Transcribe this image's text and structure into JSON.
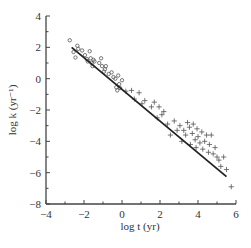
{
  "chart_data": {
    "type": "scatter",
    "title": "",
    "xlabel": "log t  (yr)",
    "ylabel": "log k  (yr⁻¹)",
    "xlim": [
      -4,
      6
    ],
    "ylim": [
      -8,
      4
    ],
    "x_ticks": [
      -4,
      -2,
      0,
      2,
      4,
      6
    ],
    "y_ticks": [
      4,
      2,
      0,
      -2,
      -4,
      -6,
      -8
    ],
    "x_tick_labels": [
      "−4",
      "−2",
      "0",
      "2",
      "4",
      "6"
    ],
    "y_tick_labels": [
      "4",
      "2",
      "0",
      "−2",
      "−4",
      "−6",
      "−8"
    ],
    "grid": false,
    "legend": null,
    "series": [
      {
        "name": "circles",
        "marker": "circle-open",
        "points": [
          [
            -2.75,
            2.45
          ],
          [
            -2.55,
            1.7
          ],
          [
            -2.45,
            1.35
          ],
          [
            -2.35,
            2.1
          ],
          [
            -2.3,
            1.9
          ],
          [
            -2.1,
            1.8
          ],
          [
            -1.95,
            1.5
          ],
          [
            -1.85,
            1.25
          ],
          [
            -1.8,
            1.1
          ],
          [
            -1.7,
            1.75
          ],
          [
            -1.65,
            1.3
          ],
          [
            -1.6,
            1.0
          ],
          [
            -1.55,
            0.8
          ],
          [
            -1.5,
            1.2
          ],
          [
            -1.45,
            1.1
          ],
          [
            -1.2,
            1.0
          ],
          [
            -1.1,
            1.3
          ],
          [
            -1.05,
            0.8
          ],
          [
            -0.95,
            0.45
          ],
          [
            -0.9,
            0.6
          ],
          [
            -0.85,
            0.8
          ],
          [
            -0.7,
            0.3
          ],
          [
            -0.55,
            0.4
          ],
          [
            -0.45,
            0.1
          ],
          [
            -0.35,
            0.0
          ],
          [
            -0.3,
            -0.55
          ],
          [
            -0.25,
            -0.75
          ],
          [
            -0.2,
            0.2
          ],
          [
            -0.15,
            -0.35
          ],
          [
            -0.1,
            -0.6
          ],
          [
            0.0,
            -0.1
          ]
        ]
      },
      {
        "name": "crosses",
        "marker": "plus",
        "points": [
          [
            0.2,
            -0.8
          ],
          [
            0.5,
            -0.75
          ],
          [
            0.65,
            -1.3
          ],
          [
            0.9,
            -0.9
          ],
          [
            1.05,
            -1.6
          ],
          [
            1.2,
            -1.4
          ],
          [
            1.55,
            -1.8
          ],
          [
            1.7,
            -1.5
          ],
          [
            1.85,
            -2.5
          ],
          [
            1.95,
            -1.8
          ],
          [
            2.1,
            -2.3
          ],
          [
            2.2,
            -2.1
          ],
          [
            2.4,
            -2.9
          ],
          [
            2.55,
            -3.6
          ],
          [
            2.75,
            -2.7
          ],
          [
            2.9,
            -3.3
          ],
          [
            3.05,
            -3.0
          ],
          [
            3.15,
            -4.0
          ],
          [
            3.25,
            -3.3
          ],
          [
            3.35,
            -3.6
          ],
          [
            3.45,
            -2.8
          ],
          [
            3.55,
            -3.1
          ],
          [
            3.6,
            -4.2
          ],
          [
            3.7,
            -3.5
          ],
          [
            3.75,
            -2.9
          ],
          [
            3.85,
            -3.9
          ],
          [
            3.9,
            -4.4
          ],
          [
            3.95,
            -3.2
          ],
          [
            4.0,
            -3.7
          ],
          [
            4.1,
            -4.1
          ],
          [
            4.2,
            -3.4
          ],
          [
            4.25,
            -4.5
          ],
          [
            4.35,
            -4.0
          ],
          [
            4.45,
            -3.6
          ],
          [
            4.55,
            -4.7
          ],
          [
            4.6,
            -4.2
          ],
          [
            4.7,
            -3.6
          ],
          [
            4.8,
            -4.8
          ],
          [
            4.9,
            -4.4
          ],
          [
            5.0,
            -5.0
          ],
          [
            5.1,
            -5.2
          ],
          [
            5.2,
            -5.6
          ],
          [
            5.35,
            -5.0
          ],
          [
            5.5,
            -5.8
          ],
          [
            5.75,
            -6.9
          ]
        ]
      }
    ],
    "regression_line": {
      "x": [
        -2.65,
        5.5
      ],
      "y": [
        2.0,
        -6.25
      ]
    }
  }
}
